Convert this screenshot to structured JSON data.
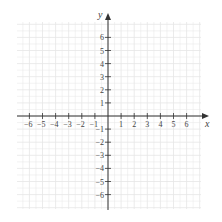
{
  "chart_data": {
    "type": "coordinate-plane",
    "title": "",
    "xlabel": "x",
    "ylabel": "y",
    "xlim": [
      -7,
      7
    ],
    "ylim": [
      -7,
      7
    ],
    "x_tick_labels": [
      "−6",
      "−5",
      "−4",
      "−3",
      "−2",
      "−1",
      "1",
      "2",
      "3",
      "4",
      "5",
      "6"
    ],
    "x_ticks": [
      -6,
      -5,
      -4,
      -3,
      -2,
      -1,
      1,
      2,
      3,
      4,
      5,
      6
    ],
    "y_tick_labels": [
      "6",
      "5",
      "4",
      "3",
      "2",
      "1",
      "−1",
      "−2",
      "−3",
      "−4",
      "−5",
      "−6"
    ],
    "y_ticks": [
      6,
      5,
      4,
      3,
      2,
      1,
      -1,
      -2,
      -3,
      -4,
      -5,
      -6
    ],
    "grid": true,
    "grid_minor_divisions": 2,
    "data_points": []
  },
  "colors": {
    "axis": "#333333",
    "grid": "#e6e6e6",
    "label": "#444444"
  }
}
